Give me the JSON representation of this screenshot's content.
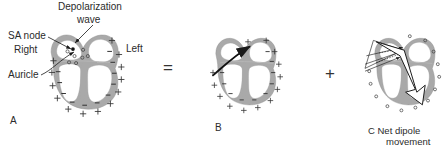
{
  "figure": {
    "caption_letters": {
      "a": "A",
      "b": "B",
      "c": "C"
    },
    "operators": {
      "equals": "=",
      "plus": "+"
    },
    "panel_a": {
      "label": "A",
      "annotations": [
        {
          "name": "depolarization-wave",
          "line1": "Depolarization",
          "line2": "wave"
        },
        {
          "name": "sa-node",
          "text": "SA node"
        },
        {
          "name": "right",
          "text": "Right"
        },
        {
          "name": "left",
          "text": "Left"
        },
        {
          "name": "auricle",
          "text": "Auricle"
        }
      ],
      "charge_outside": "+",
      "charge_inside": "−",
      "charge_small": "o"
    },
    "panel_b": {
      "label": "B",
      "charge_outside": "+",
      "charge_inside": "−"
    },
    "panel_c": {
      "label": "C",
      "caption_line1": "C Net dipole",
      "caption_line2": "movement",
      "caption_word_c": "C",
      "caption_words": "Net dipole",
      "charge_small": "o"
    },
    "colors": {
      "myocardium_gray": "#a9a9a9",
      "myocardium_gray_light": "#c3c3c3",
      "line_black": "#1a1a1a",
      "background": "#ffffff"
    }
  }
}
